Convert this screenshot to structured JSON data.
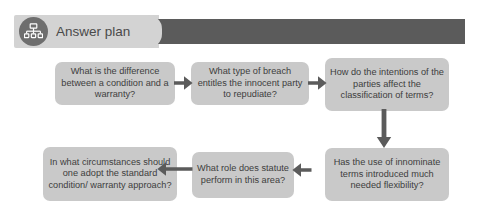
{
  "header": {
    "title": "Answer plan",
    "icon": "org-chart-icon",
    "light_color": "#d3d3d3",
    "dark_color": "#5b5b5b",
    "icon_circle_color": "#6e6e6e"
  },
  "diagram": {
    "type": "flowchart",
    "node_color": "#c9c9c9",
    "arrow_color": "#5b5b5b",
    "text_color": "#3d3d3d",
    "nodes": [
      {
        "id": "node-1",
        "text": "What is the difference between a condition and a warranty?"
      },
      {
        "id": "node-2",
        "text": "What type of breach entitles the innocent party to repudiate?"
      },
      {
        "id": "node-3",
        "text": "How do the intentions of the parties affect the classification of terms?"
      },
      {
        "id": "node-4",
        "text": "Has the use of innominate terms introduced much needed flexibility?"
      },
      {
        "id": "node-5",
        "text": "What role does statute perform in this area?"
      },
      {
        "id": "node-6",
        "text": "In what circumstances should one adopt the standard condition/ warranty approach?"
      }
    ],
    "arrows": [
      {
        "id": "arrow-1",
        "from": "node-1",
        "to": "node-2",
        "direction": "right"
      },
      {
        "id": "arrow-2",
        "from": "node-2",
        "to": "node-3",
        "direction": "right"
      },
      {
        "id": "arrow-3",
        "from": "node-3",
        "to": "node-4",
        "direction": "down"
      },
      {
        "id": "arrow-4",
        "from": "node-4",
        "to": "node-5",
        "direction": "left"
      },
      {
        "id": "arrow-5",
        "from": "node-5",
        "to": "node-6",
        "direction": "left"
      }
    ]
  }
}
